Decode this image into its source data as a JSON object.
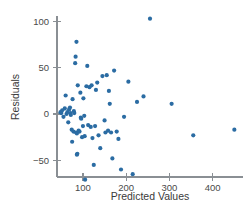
{
  "chart_data": {
    "type": "scatter",
    "title": "",
    "xlabel": "Predicted Values",
    "ylabel": "Residuals",
    "xlim": [
      40,
      470
    ],
    "ylim": [
      -80,
      112
    ],
    "grid": false,
    "legend": "none",
    "point_color": "#2b6ca3",
    "axis_color": "#8a8f94",
    "text_color": "#3a3a3a",
    "xticks": [
      100,
      200,
      300,
      400
    ],
    "xticklabels": [
      "100",
      "200",
      "300",
      "400"
    ],
    "yticks": [
      -50,
      0,
      50,
      100
    ],
    "yticklabels": [
      "−50",
      "0",
      "50",
      "100"
    ],
    "series": [
      {
        "name": "residuals",
        "points": [
          [
            48,
            2
          ],
          [
            50,
            1
          ],
          [
            52,
            4
          ],
          [
            55,
            -3
          ],
          [
            58,
            6
          ],
          [
            60,
            20
          ],
          [
            62,
            0
          ],
          [
            64,
            2
          ],
          [
            66,
            -9
          ],
          [
            68,
            5
          ],
          [
            70,
            7
          ],
          [
            71,
            1
          ],
          [
            72,
            -1
          ],
          [
            74,
            -17
          ],
          [
            75,
            -30
          ],
          [
            76,
            16
          ],
          [
            78,
            -19
          ],
          [
            79,
            3
          ],
          [
            80,
            1
          ],
          [
            82,
            55
          ],
          [
            83,
            62
          ],
          [
            84,
            -20
          ],
          [
            85,
            78
          ],
          [
            86,
            -21
          ],
          [
            86,
            -44
          ],
          [
            87,
            -43
          ],
          [
            88,
            31
          ],
          [
            90,
            -18
          ],
          [
            92,
            -19
          ],
          [
            94,
            23
          ],
          [
            95,
            -4
          ],
          [
            96,
            -5
          ],
          [
            98,
            -25
          ],
          [
            100,
            -13
          ],
          [
            101,
            17
          ],
          [
            103,
            -2
          ],
          [
            104,
            -24
          ],
          [
            105,
            -71
          ],
          [
            108,
            30
          ],
          [
            110,
            52
          ],
          [
            112,
            -12
          ],
          [
            115,
            29
          ],
          [
            118,
            -14
          ],
          [
            120,
            31
          ],
          [
            122,
            -26
          ],
          [
            125,
            -55
          ],
          [
            128,
            -13
          ],
          [
            130,
            26
          ],
          [
            133,
            34
          ],
          [
            136,
            -23
          ],
          [
            140,
            -37
          ],
          [
            145,
            41
          ],
          [
            150,
            -7
          ],
          [
            152,
            -20
          ],
          [
            155,
            42
          ],
          [
            158,
            -18
          ],
          [
            160,
            25
          ],
          [
            162,
            11
          ],
          [
            165,
            -20
          ],
          [
            168,
            -48
          ],
          [
            172,
            47
          ],
          [
            178,
            -19
          ],
          [
            182,
            -27
          ],
          [
            188,
            -60
          ],
          [
            195,
            -3
          ],
          [
            205,
            35
          ],
          [
            215,
            -65
          ],
          [
            225,
            13
          ],
          [
            240,
            19
          ],
          [
            255,
            103
          ],
          [
            305,
            11
          ],
          [
            355,
            -23
          ],
          [
            450,
            -17
          ]
        ]
      }
    ]
  },
  "axes": {
    "geometry_note": "pixel mapping for rendering",
    "x_origin_px": 57,
    "y_zero_px": 114,
    "x_px_per_unit": 0.412,
    "y_px_per_unit": 0.925,
    "x_axis_y_px": 177,
    "y_axis_x_px": 57,
    "y_axis_top_px": 16,
    "y_axis_bottom_px": 177,
    "x_axis_left_px": 57,
    "x_axis_right_px": 243,
    "point_radius": 2.1
  }
}
